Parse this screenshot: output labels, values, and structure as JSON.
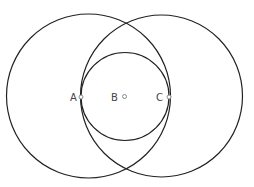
{
  "diagram": {
    "background": "#ffffff",
    "stroke_color": "#222222",
    "point_color": "#8a8a8a",
    "label_color": "#444444",
    "circles": [
      {
        "name": "left-circle",
        "cx": 88.5,
        "cy": 96,
        "r": 82
      },
      {
        "name": "right-circle",
        "cx": 161.5,
        "cy": 96,
        "r": 81
      },
      {
        "name": "inner-circle",
        "cx": 125,
        "cy": 96.5,
        "r": 44
      }
    ],
    "points": [
      {
        "label": "A",
        "x": 81,
        "y": 97,
        "label_x": 70,
        "label_y": 101
      },
      {
        "label": "B",
        "x": 124.5,
        "y": 96.5,
        "label_x": 111,
        "label_y": 101
      },
      {
        "label": "C",
        "x": 169,
        "y": 97,
        "label_x": 156,
        "label_y": 101
      }
    ]
  }
}
